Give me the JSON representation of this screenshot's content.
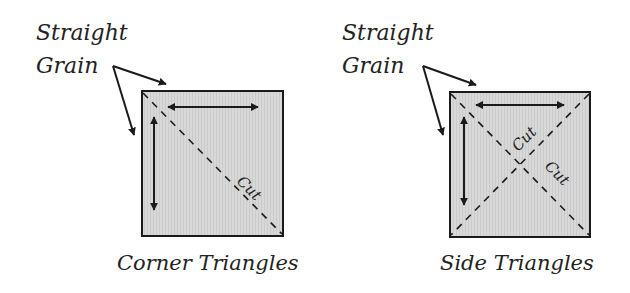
{
  "diagrams": [
    {
      "grain_label_line1": "Straight",
      "grain_label_line2": "Grain",
      "cut_labels": [
        "Cut"
      ],
      "caption": "Corner Triangles"
    },
    {
      "grain_label_line1": "Straight",
      "grain_label_line2": "Grain",
      "cut_labels": [
        "Cut",
        "Cut"
      ],
      "caption": "Side Triangles"
    }
  ],
  "colors": {
    "fabric_fill": "#d6d6d6",
    "stroke": "#1a1a1a"
  }
}
